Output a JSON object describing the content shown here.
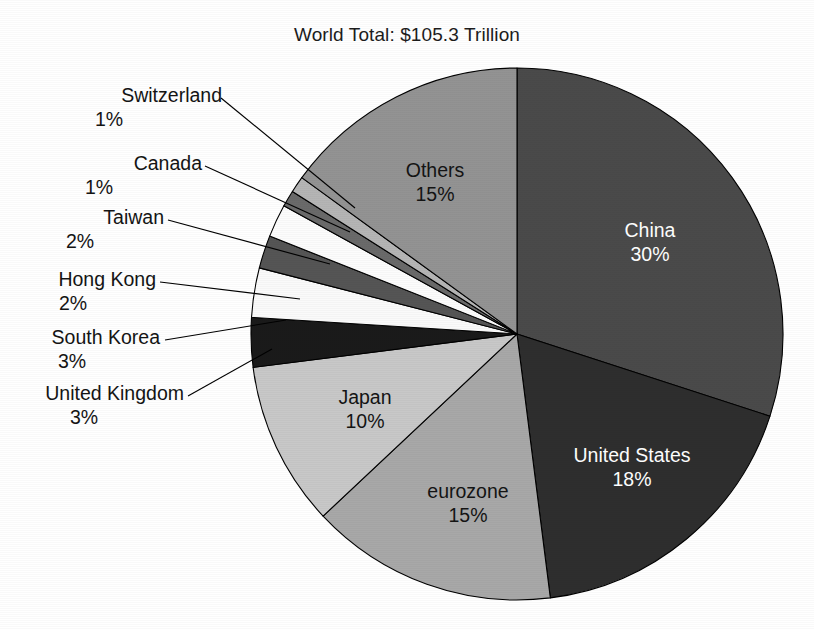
{
  "chart_data": {
    "type": "pie",
    "title": "World Total: $105.3 Trillion",
    "xlabel": "",
    "ylabel": "",
    "legend": "none",
    "grid": false,
    "start_angle_deg": 0,
    "direction": "clockwise",
    "categories": [
      "China",
      "United States",
      "eurozone",
      "Japan",
      "United Kingdom",
      "South Korea",
      "Hong Kong",
      "Taiwan",
      "Canada",
      "Switzerland",
      "Others"
    ],
    "values": [
      30,
      18,
      15,
      10,
      3,
      3,
      2,
      2,
      1,
      1,
      15
    ],
    "value_labels": [
      "30%",
      "18%",
      "15%",
      "10%",
      "3%",
      "3%",
      "2%",
      "2%",
      "1%",
      "1%",
      "15%"
    ],
    "colors": [
      "#4a4a4a",
      "#2e2e2e",
      "#a8a8a8",
      "#c8c8c8",
      "#1a1a1a",
      "#fafafa",
      "#555555",
      "#fcfcfc",
      "#6a6a6a",
      "#b5b5b5",
      "#939393"
    ],
    "slices": [
      {
        "name": "China",
        "value": 30,
        "label": "China",
        "pct": "30%",
        "color": "#4a4a4a",
        "label_placement": "inside",
        "text_color": "light"
      },
      {
        "name": "United States",
        "value": 18,
        "label": "United States",
        "pct": "18%",
        "color": "#2e2e2e",
        "label_placement": "inside",
        "text_color": "light"
      },
      {
        "name": "eurozone",
        "value": 15,
        "label": "eurozone",
        "pct": "15%",
        "color": "#a8a8a8",
        "label_placement": "inside",
        "text_color": "dark"
      },
      {
        "name": "Japan",
        "value": 10,
        "label": "Japan",
        "pct": "10%",
        "color": "#c8c8c8",
        "label_placement": "inside",
        "text_color": "dark"
      },
      {
        "name": "United Kingdom",
        "value": 3,
        "label": "United Kingdom",
        "pct": "3%",
        "color": "#1a1a1a",
        "label_placement": "callout",
        "text_color": "dark"
      },
      {
        "name": "South Korea",
        "value": 3,
        "label": "South Korea",
        "pct": "3%",
        "color": "#fafafa",
        "label_placement": "callout",
        "text_color": "dark"
      },
      {
        "name": "Hong Kong",
        "value": 2,
        "label": "Hong Kong",
        "pct": "2%",
        "color": "#555555",
        "label_placement": "callout",
        "text_color": "dark"
      },
      {
        "name": "Taiwan",
        "value": 2,
        "label": "Taiwan",
        "pct": "2%",
        "color": "#fcfcfc",
        "label_placement": "callout",
        "text_color": "dark"
      },
      {
        "name": "Canada",
        "value": 1,
        "label": "Canada",
        "pct": "1%",
        "color": "#6a6a6a",
        "label_placement": "callout",
        "text_color": "dark"
      },
      {
        "name": "Switzerland",
        "value": 1,
        "label": "Switzerland",
        "pct": "1%",
        "color": "#b5b5b5",
        "label_placement": "callout",
        "text_color": "dark"
      },
      {
        "name": "Others",
        "value": 15,
        "label": "Others",
        "pct": "15%",
        "color": "#939393",
        "label_placement": "inside",
        "text_color": "dark"
      }
    ]
  },
  "callouts": {
    "switzerland": {
      "name": "Switzerland",
      "pct": "1%"
    },
    "canada": {
      "name": "Canada",
      "pct": "1%"
    },
    "taiwan": {
      "name": "Taiwan",
      "pct": "2%"
    },
    "hong_kong": {
      "name": "Hong Kong",
      "pct": "2%"
    },
    "south_korea": {
      "name": "South Korea",
      "pct": "3%"
    },
    "united_kingdom": {
      "name": "United Kingdom",
      "pct": "3%"
    }
  },
  "inside_labels": {
    "others": {
      "name": "Others",
      "pct": "15%"
    },
    "china": {
      "name": "China",
      "pct": "30%"
    },
    "united_states": {
      "name": "United States",
      "pct": "18%"
    },
    "eurozone": {
      "name": "eurozone",
      "pct": "15%"
    },
    "japan": {
      "name": "Japan",
      "pct": "10%"
    }
  },
  "style": {
    "background": "#ffffff",
    "outline": "#000000",
    "title_color": "#1c1c1c"
  }
}
